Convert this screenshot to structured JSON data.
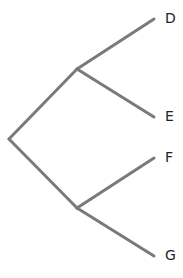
{
  "diagram": {
    "type": "tree",
    "edge_color": "#7a7a7a",
    "nodes": {
      "root": {
        "x": 9,
        "y": 139
      },
      "upper": {
        "x": 77,
        "y": 69
      },
      "lower": {
        "x": 77,
        "y": 208
      }
    },
    "leaves": [
      {
        "label": "D",
        "x": 154,
        "y": 19,
        "lx": 166,
        "ly": 12
      },
      {
        "label": "E",
        "x": 154,
        "y": 117,
        "lx": 166,
        "ly": 110
      },
      {
        "label": "F",
        "x": 154,
        "y": 158,
        "lx": 166,
        "ly": 151
      },
      {
        "label": "G",
        "x": 154,
        "y": 256,
        "lx": 166,
        "ly": 249
      }
    ]
  }
}
